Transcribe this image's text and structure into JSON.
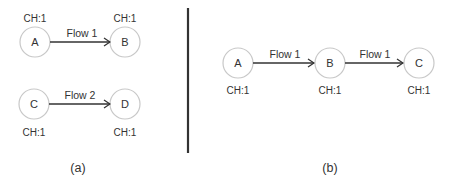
{
  "panel_a": {
    "caption": "(a)",
    "nodes": [
      {
        "id": "A",
        "label": "A",
        "ch": "CH:1"
      },
      {
        "id": "B",
        "label": "B",
        "ch": "CH:1"
      },
      {
        "id": "C",
        "label": "C",
        "ch": "CH:1"
      },
      {
        "id": "D",
        "label": "D",
        "ch": "CH:1"
      }
    ],
    "edges": [
      {
        "from": "A",
        "to": "B",
        "label": "Flow 1"
      },
      {
        "from": "C",
        "to": "D",
        "label": "Flow 2"
      }
    ]
  },
  "panel_b": {
    "caption": "(b)",
    "nodes": [
      {
        "id": "A",
        "label": "A",
        "ch": "CH:1"
      },
      {
        "id": "B",
        "label": "B",
        "ch": "CH:1"
      },
      {
        "id": "C",
        "label": "C",
        "ch": "CH:1"
      }
    ],
    "edges": [
      {
        "from": "A",
        "to": "B",
        "label": "Flow 1"
      },
      {
        "from": "B",
        "to": "C",
        "label": "Flow 1"
      }
    ]
  },
  "colors": {
    "node_stroke": "#c8c8c8",
    "edge": "#333333",
    "text": "#333333"
  }
}
